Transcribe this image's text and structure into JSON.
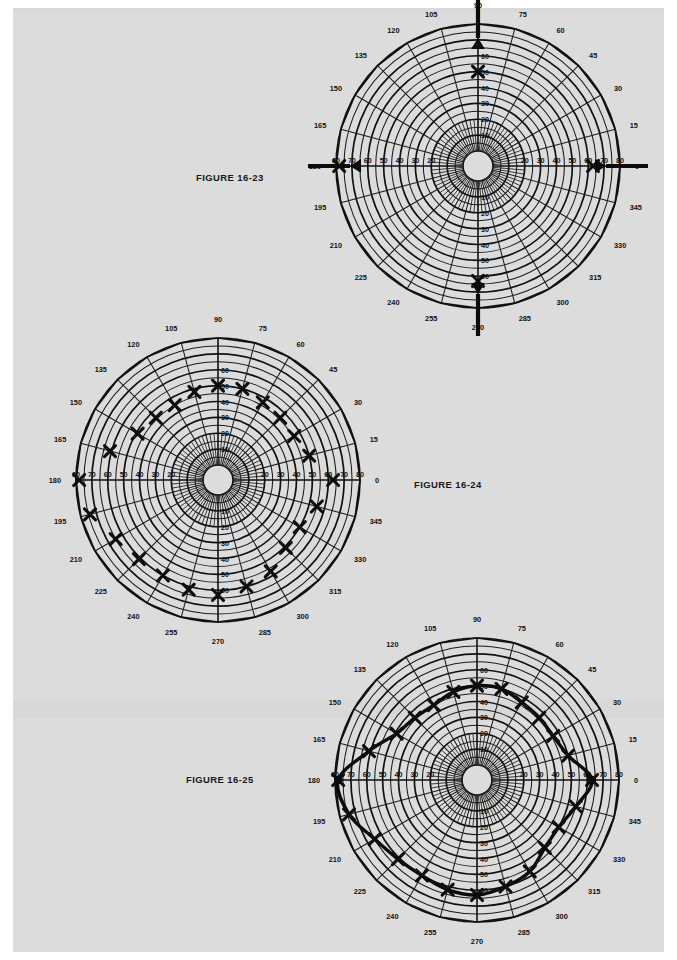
{
  "page": {
    "background": "#dcdcdc",
    "paper": "#ffffff"
  },
  "figures": [
    {
      "id": "figure-16-23",
      "label": "FIGURE 16-23",
      "label_position": "left",
      "chart_data": {
        "type": "scatter",
        "plot_kind": "polar",
        "title": "FIGURE 16-23",
        "angle_unit": "degrees",
        "angle_ticks": [
          0,
          15,
          30,
          45,
          60,
          75,
          90,
          105,
          120,
          135,
          150,
          165,
          180,
          195,
          210,
          225,
          240,
          255,
          270,
          285,
          300,
          315,
          330,
          345
        ],
        "radial_ticks": [
          10,
          20,
          30,
          40,
          50,
          60
        ],
        "radial_axis_labels_left": [
          80,
          70,
          60,
          50,
          40,
          30,
          20
        ],
        "radial_axis_labels_right": [
          20,
          30,
          40,
          50,
          60,
          70,
          80
        ],
        "rlim": [
          0,
          80
        ],
        "grid": true,
        "legend": false,
        "series": [
          {
            "name": "measured points",
            "marker": "x",
            "points": [
              {
                "angle": 0,
                "r": 63
              },
              {
                "angle": 90,
                "r": 50
              },
              {
                "angle": 180,
                "r": 78
              },
              {
                "angle": 270,
                "r": 63
              }
            ]
          },
          {
            "name": "inward arrows",
            "marker": "arrow",
            "points": [
              {
                "angle": 0,
                "r": 80
              },
              {
                "angle": 90,
                "r": 80
              },
              {
                "angle": 180,
                "r": 80
              },
              {
                "angle": 270,
                "r": 80
              }
            ]
          }
        ]
      }
    },
    {
      "id": "figure-16-24",
      "label": "FIGURE 16-24",
      "label_position": "right",
      "chart_data": {
        "type": "scatter",
        "plot_kind": "polar",
        "title": "FIGURE 16-24",
        "angle_unit": "degrees",
        "angle_ticks": [
          0,
          15,
          30,
          45,
          60,
          75,
          90,
          105,
          120,
          135,
          150,
          165,
          180,
          195,
          210,
          225,
          240,
          255,
          270,
          285,
          300,
          315,
          330,
          345
        ],
        "radial_ticks": [
          10,
          20,
          30,
          40,
          50,
          60
        ],
        "radial_axis_labels_left": [
          80,
          70,
          60,
          50,
          40,
          30,
          20
        ],
        "radial_axis_labels_right": [
          20,
          30,
          40,
          50,
          60,
          70,
          80
        ],
        "rlim": [
          0,
          80
        ],
        "grid": true,
        "legend": false,
        "series": [
          {
            "name": "measured points",
            "marker": "x",
            "points": [
              {
                "angle": 0,
                "r": 63
              },
              {
                "angle": 15,
                "r": 50
              },
              {
                "angle": 30,
                "r": 46
              },
              {
                "angle": 45,
                "r": 46
              },
              {
                "angle": 60,
                "r": 47
              },
              {
                "angle": 75,
                "r": 50
              },
              {
                "angle": 90,
                "r": 50
              },
              {
                "angle": 105,
                "r": 48
              },
              {
                "angle": 120,
                "r": 45
              },
              {
                "angle": 135,
                "r": 46
              },
              {
                "angle": 150,
                "r": 49
              },
              {
                "angle": 165,
                "r": 61
              },
              {
                "angle": 180,
                "r": 78
              },
              {
                "angle": 195,
                "r": 74
              },
              {
                "angle": 210,
                "r": 65
              },
              {
                "angle": 225,
                "r": 61
              },
              {
                "angle": 240,
                "r": 60
              },
              {
                "angle": 255,
                "r": 62
              },
              {
                "angle": 270,
                "r": 63
              },
              {
                "angle": 285,
                "r": 60
              },
              {
                "angle": 300,
                "r": 57
              },
              {
                "angle": 315,
                "r": 51
              },
              {
                "angle": 330,
                "r": 50
              },
              {
                "angle": 345,
                "r": 55
              }
            ]
          }
        ]
      }
    },
    {
      "id": "figure-16-25",
      "label": "FIGURE 16-25",
      "label_position": "left",
      "chart_data": {
        "type": "line",
        "plot_kind": "polar",
        "title": "FIGURE 16-25",
        "angle_unit": "degrees",
        "angle_ticks": [
          0,
          15,
          30,
          45,
          60,
          75,
          90,
          105,
          120,
          135,
          150,
          165,
          180,
          195,
          210,
          225,
          240,
          255,
          270,
          285,
          300,
          315,
          330,
          345
        ],
        "radial_ticks": [
          10,
          20,
          30,
          40,
          50,
          60
        ],
        "radial_axis_labels_left": [
          80,
          70,
          60,
          50,
          40,
          30,
          20
        ],
        "radial_axis_labels_right": [
          20,
          30,
          40,
          50,
          60,
          70,
          80
        ],
        "rlim": [
          0,
          80
        ],
        "grid": true,
        "legend": false,
        "closed_curve": true,
        "series": [
          {
            "name": "fitted contour",
            "marker": "x",
            "points": [
              {
                "angle": 0,
                "r": 63
              },
              {
                "angle": 15,
                "r": 50
              },
              {
                "angle": 30,
                "r": 46
              },
              {
                "angle": 45,
                "r": 46
              },
              {
                "angle": 60,
                "r": 47
              },
              {
                "angle": 75,
                "r": 50
              },
              {
                "angle": 90,
                "r": 50
              },
              {
                "angle": 105,
                "r": 48
              },
              {
                "angle": 120,
                "r": 45
              },
              {
                "angle": 135,
                "r": 46
              },
              {
                "angle": 150,
                "r": 49
              },
              {
                "angle": 165,
                "r": 61
              },
              {
                "angle": 180,
                "r": 78
              },
              {
                "angle": 195,
                "r": 74
              },
              {
                "angle": 210,
                "r": 65
              },
              {
                "angle": 225,
                "r": 61
              },
              {
                "angle": 240,
                "r": 60
              },
              {
                "angle": 255,
                "r": 62
              },
              {
                "angle": 270,
                "r": 63
              },
              {
                "angle": 285,
                "r": 60
              },
              {
                "angle": 300,
                "r": 57
              },
              {
                "angle": 315,
                "r": 51
              },
              {
                "angle": 330,
                "r": 50
              },
              {
                "angle": 345,
                "r": 55
              }
            ]
          }
        ]
      }
    }
  ]
}
